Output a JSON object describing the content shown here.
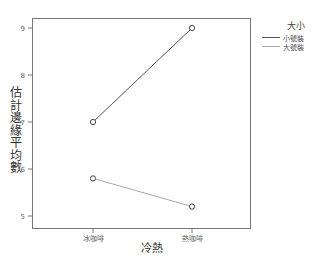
{
  "chart_data": {
    "type": "line",
    "title": "",
    "xlabel": "冷熱",
    "ylabel": "估計邊緣平均數",
    "categories": [
      "冰咖啡",
      "熱咖啡"
    ],
    "series": [
      {
        "name": "小號裝",
        "values": [
          7.0,
          9.0
        ],
        "color": "#555555"
      },
      {
        "name": "大號裝",
        "values": [
          5.8,
          5.2
        ],
        "color": "#aaaaaa"
      }
    ],
    "ylim": [
      4.75,
      9.2
    ],
    "yticks": [
      5,
      6,
      7,
      8,
      9
    ],
    "grid": false,
    "legend_title": "大小",
    "legend_position": "right",
    "markers": "open-circle"
  },
  "axes": {
    "ylabel_chars": [
      "估",
      "計",
      "邊",
      "緣",
      "平",
      "均",
      "數"
    ],
    "xlabel": "冷熱",
    "yticks": [
      "5",
      "6",
      "7",
      "8",
      "9"
    ],
    "xticks": [
      "冰咖啡",
      "熱咖啡"
    ]
  },
  "legend": {
    "title": "大小",
    "items": [
      {
        "label": "小號裝",
        "color": "#555555"
      },
      {
        "label": "大號裝",
        "color": "#aaaaaa"
      }
    ]
  }
}
